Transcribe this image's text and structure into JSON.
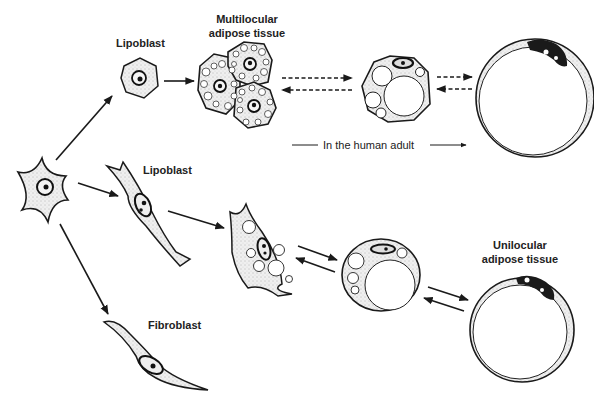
{
  "figure": {
    "type": "cell-differentiation-diagram",
    "colors": {
      "ink": "#1a1a1a",
      "cytoplasm": "#e6e6e6",
      "background": "#ffffff"
    }
  },
  "labels": {
    "lipoblast_top": "Lipoblast",
    "multilocular_line1": "Multilocular",
    "multilocular_line2": "adipose tissue",
    "human_adult": "In the human adult",
    "lipoblast_middle": "Lipoblast",
    "unilocular_line1": "Unilocular",
    "unilocular_line2": "adipose tissue",
    "fibroblast": "Fibroblast"
  },
  "nodes": [
    {
      "id": "mesenchymal-cell",
      "label": ""
    },
    {
      "id": "lipoblast-top",
      "label": "Lipoblast"
    },
    {
      "id": "multilocular-cluster",
      "label": "Multilocular adipose tissue"
    },
    {
      "id": "transitional-cell-top",
      "label": ""
    },
    {
      "id": "unilocular-cell-top",
      "label": ""
    },
    {
      "id": "lipoblast-middle",
      "label": "Lipoblast"
    },
    {
      "id": "developing-adipocyte",
      "label": ""
    },
    {
      "id": "transitional-cell-bottom",
      "label": ""
    },
    {
      "id": "unilocular-cell-bottom",
      "label": "Unilocular adipose tissue"
    },
    {
      "id": "fibroblast",
      "label": "Fibroblast"
    }
  ],
  "edges": [
    {
      "from": "mesenchymal-cell",
      "to": "lipoblast-top",
      "style": "solid"
    },
    {
      "from": "mesenchymal-cell",
      "to": "lipoblast-middle",
      "style": "solid"
    },
    {
      "from": "mesenchymal-cell",
      "to": "fibroblast",
      "style": "solid"
    },
    {
      "from": "lipoblast-top",
      "to": "multilocular-cluster",
      "style": "solid"
    },
    {
      "from": "multilocular-cluster",
      "to": "transitional-cell-top",
      "style": "dashed",
      "bidirectional": true
    },
    {
      "from": "transitional-cell-top",
      "to": "unilocular-cell-top",
      "style": "dashed",
      "bidirectional": true
    },
    {
      "from": "lipoblast-middle",
      "to": "developing-adipocyte",
      "style": "solid"
    },
    {
      "from": "developing-adipocyte",
      "to": "transitional-cell-bottom",
      "style": "solid",
      "bidirectional": true
    },
    {
      "from": "transitional-cell-bottom",
      "to": "unilocular-cell-bottom",
      "style": "solid",
      "bidirectional": true
    }
  ]
}
